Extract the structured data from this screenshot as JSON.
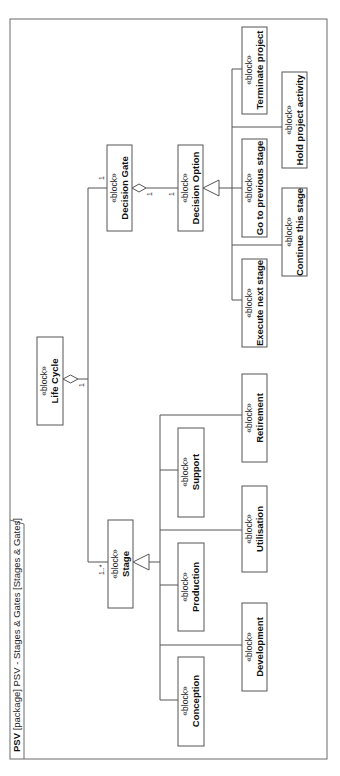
{
  "diagram": {
    "frame": {
      "kind": "PSV",
      "rest": " [package] PSV - Stages & Gates [Stages & Gates]"
    },
    "stereotype": "«block»",
    "blocks": {
      "life_cycle": "Life Cycle",
      "decision_gate": "Decision Gate",
      "decision_option": "Decision Option",
      "stage": "Stage",
      "conception": "Conception",
      "development": "Development",
      "production": "Production",
      "utilisation": "Utilisation",
      "support": "Support",
      "retirement": "Retirement",
      "execute_next_stage": "Execute next stage",
      "continue_this_stage": "Continue this stage",
      "go_to_previous_stage": "Go to previous stage",
      "hold_project_activity": "Hold project activity",
      "terminate_project": "Terminate project"
    },
    "multiplicities": {
      "lifecycle_end": "1",
      "gate_end": "1",
      "stage_end": "1..*",
      "gate_owner_end": "1",
      "option_end": "1"
    }
  }
}
